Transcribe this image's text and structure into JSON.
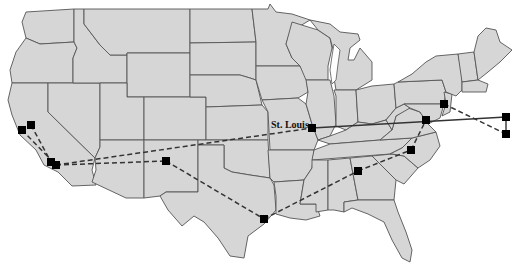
{
  "map": {
    "title": "Continental United States network map",
    "colors": {
      "land": "#d6d6d6",
      "border": "#555555",
      "water": "#ffffff",
      "node": "#000000",
      "edge": "#333333"
    },
    "labels": [
      {
        "id": "st-louis",
        "text": "St. Louis",
        "x": 271,
        "y": 128
      }
    ],
    "nodes": [
      {
        "id": "sf-a",
        "x": 22,
        "y": 130
      },
      {
        "id": "sf-b",
        "x": 31,
        "y": 125
      },
      {
        "id": "la-a",
        "x": 51,
        "y": 162
      },
      {
        "id": "la-b",
        "x": 56,
        "y": 165
      },
      {
        "id": "southwest",
        "x": 166,
        "y": 161
      },
      {
        "id": "st-louis",
        "x": 312,
        "y": 128
      },
      {
        "id": "houston",
        "x": 264,
        "y": 219
      },
      {
        "id": "atlanta",
        "x": 358,
        "y": 171
      },
      {
        "id": "north-carolina",
        "x": 411,
        "y": 150
      },
      {
        "id": "washington-dc",
        "x": 426,
        "y": 120
      },
      {
        "id": "new-jersey",
        "x": 444,
        "y": 104
      },
      {
        "id": "offshore-a",
        "x": 506,
        "y": 117
      },
      {
        "id": "offshore-b",
        "x": 506,
        "y": 134
      }
    ],
    "edges": [
      {
        "from": "sf-b",
        "to": "la-a",
        "style": "dashed"
      },
      {
        "from": "sf-a",
        "to": "la-b",
        "style": "dashed"
      },
      {
        "from": "la-b",
        "to": "st-louis",
        "style": "dashed"
      },
      {
        "from": "la-b",
        "to": "southwest",
        "style": "dashed"
      },
      {
        "from": "southwest",
        "to": "houston",
        "style": "dashed"
      },
      {
        "from": "houston",
        "to": "atlanta",
        "style": "dashed"
      },
      {
        "from": "atlanta",
        "to": "north-carolina",
        "style": "dashed"
      },
      {
        "from": "north-carolina",
        "to": "washington-dc",
        "style": "dashed"
      },
      {
        "from": "st-louis",
        "to": "offshore-a",
        "style": "solid"
      },
      {
        "from": "offshore-a",
        "to": "offshore-b",
        "style": "solid"
      },
      {
        "from": "new-jersey",
        "to": "offshore-b",
        "style": "dashed"
      }
    ]
  }
}
